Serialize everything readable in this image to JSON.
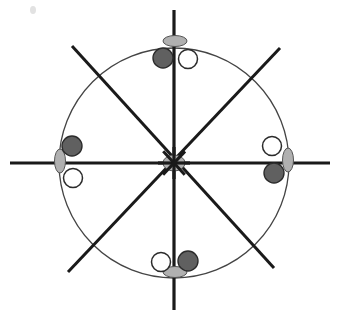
{
  "figure": {
    "name": "radial-axis-circle-diagram",
    "type": "geometric-diagram",
    "width": 318,
    "height": 318,
    "background_color": "#ffffff"
  },
  "chart_data": {
    "type": "scatter",
    "title": "",
    "subtitle": "",
    "xlabel": "",
    "ylabel": "",
    "grid": false,
    "legend": "none",
    "xlim": [
      -1.35,
      1.35
    ],
    "ylim": [
      -1.35,
      1.35
    ],
    "center": {
      "x": 174,
      "y": 163
    },
    "circle": {
      "name": "reference-circle",
      "center_x": 174,
      "center_y": 163,
      "radius": 115,
      "stroke": "#444444",
      "stroke_width": 1.3,
      "fill": "none"
    },
    "axes": [
      {
        "name": "vertical-axis",
        "angle_deg": 90,
        "x1": 174,
        "y1": 10,
        "x2": 174,
        "y2": 310,
        "stroke": "#1a1a1a",
        "stroke_width": 3.2
      },
      {
        "name": "horizontal-axis",
        "angle_deg": 0,
        "x1": 10,
        "y1": 163,
        "x2": 330,
        "y2": 163,
        "stroke": "#1a1a1a",
        "stroke_width": 3.2
      },
      {
        "name": "diagonal-axis-nw-se",
        "angle_deg": 135,
        "x1": 72,
        "y1": 46,
        "x2": 274,
        "y2": 268,
        "stroke": "#1a1a1a",
        "stroke_width": 3.0
      },
      {
        "name": "diagonal-axis-ne-sw",
        "angle_deg": 45,
        "x1": 280,
        "y1": 48,
        "x2": 68,
        "y2": 272,
        "stroke": "#1a1a1a",
        "stroke_width": 3.0
      }
    ],
    "series": [
      {
        "name": "gray-ellipse-markers",
        "marker": "ellipse",
        "fill": "#b0b0b0",
        "stroke": "#555555",
        "values": [
          {
            "label": "top",
            "cx": 175,
            "cy": 41,
            "rx": 12,
            "ry": 5.5,
            "rotation": 0
          },
          {
            "label": "bottom",
            "cx": 175,
            "cy": 272,
            "rx": 12,
            "ry": 5.5,
            "rotation": 0
          },
          {
            "label": "left",
            "cx": 60,
            "cy": 161,
            "rx": 5.5,
            "ry": 12,
            "rotation": 0
          },
          {
            "label": "right",
            "cx": 288,
            "cy": 160,
            "rx": 5.5,
            "ry": 12,
            "rotation": 0
          },
          {
            "label": "center",
            "cx": 174,
            "cy": 163,
            "rx": 11,
            "ry": 8,
            "rotation": 0
          }
        ]
      },
      {
        "name": "dark-filled-circle-markers",
        "marker": "filled-circle",
        "fill": "#606060",
        "stroke": "#2b2b2b",
        "radius": 10,
        "values": [
          {
            "label": "top-left-of-vertical",
            "cx": 163,
            "cy": 58
          },
          {
            "label": "bottom-right-of-vertical",
            "cx": 188,
            "cy": 261
          },
          {
            "label": "left-upper",
            "cx": 72,
            "cy": 146
          },
          {
            "label": "right-lower",
            "cx": 274,
            "cy": 173
          }
        ]
      },
      {
        "name": "white-hollow-circle-markers",
        "marker": "open-circle",
        "fill": "#ffffff",
        "stroke": "#2b2b2b",
        "radius": 9.5,
        "values": [
          {
            "label": "top-right-of-vertical",
            "cx": 188,
            "cy": 59
          },
          {
            "label": "bottom-left-of-vertical",
            "cx": 161,
            "cy": 262
          },
          {
            "label": "left-lower",
            "cx": 73,
            "cy": 178
          },
          {
            "label": "right-upper",
            "cx": 272,
            "cy": 146
          }
        ]
      }
    ],
    "artifacts": [
      {
        "name": "speck-artifact",
        "cx": 33,
        "cy": 10,
        "rx": 3,
        "ry": 4,
        "fill": "#e2e2e2"
      }
    ],
    "annotations": []
  }
}
